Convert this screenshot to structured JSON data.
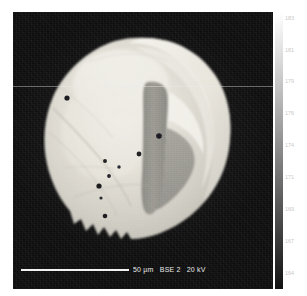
{
  "figure": {
    "type": "sem-bse-micrograph",
    "background_color": "#ffffff",
    "panel_color": "#0d0d0d"
  },
  "micrograph": {
    "name": "bse-micrograph-panel",
    "description": "Backscattered-electron micrograph of a single rounded particle"
  },
  "scalebar": {
    "length_label": "50 µm",
    "detector_label": "BSE 2",
    "voltage_label": "20 kV",
    "bar_color": "#f2f2f2"
  },
  "colorbar": {
    "name": "grayscale-intensity-colorbar",
    "orientation": "vertical",
    "high_color": "#ffffff",
    "low_color": "#111111",
    "ticks": [
      {
        "label": "183",
        "pos_pct": 1.0
      },
      {
        "label": "181",
        "pos_pct": 12.5
      },
      {
        "label": "179",
        "pos_pct": 24.0
      },
      {
        "label": "176",
        "pos_pct": 35.5
      },
      {
        "label": "174",
        "pos_pct": 47.0
      },
      {
        "label": "171",
        "pos_pct": 58.5
      },
      {
        "label": "169",
        "pos_pct": 70.0
      },
      {
        "label": "167",
        "pos_pct": 81.5
      },
      {
        "label": "164",
        "pos_pct": 93.0
      }
    ]
  },
  "chart_data": {
    "type": "heatmap",
    "title": "",
    "xlabel": "",
    "ylabel": "",
    "colormap": "grayscale",
    "legend_position": "right",
    "grid": false,
    "colorbar_label": "",
    "colorbar_range": [
      164,
      183
    ],
    "colorbar_tick_values": [
      183,
      181,
      179,
      176,
      174,
      171,
      169,
      167,
      164
    ],
    "annotations": [
      {
        "text": "50 µm",
        "role": "scale-bar-length"
      },
      {
        "text": "BSE 2",
        "role": "detector"
      },
      {
        "text": "20 kV",
        "role": "accelerating-voltage"
      }
    ],
    "features": {
      "particle_shape": "ovoid",
      "central_furrow": "dark vertical groove right of centre",
      "dark_pores": 9,
      "bright_rim": true
    }
  }
}
